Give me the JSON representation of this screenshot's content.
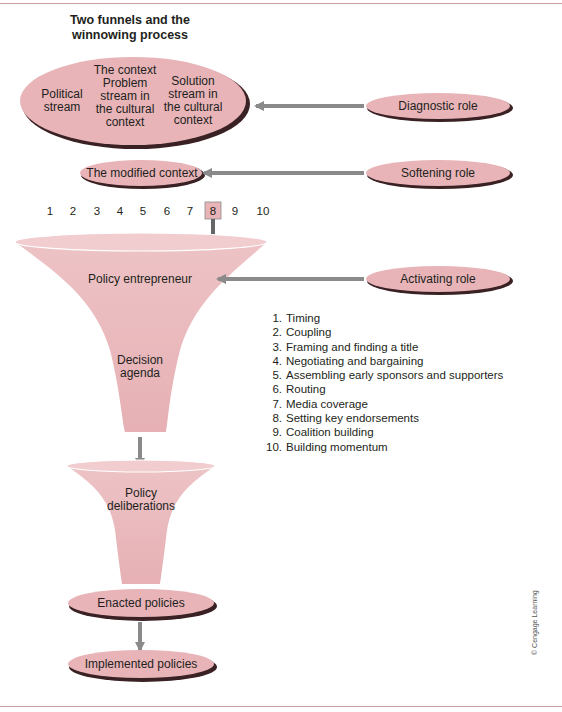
{
  "title": "Two funnels and the winnowing process",
  "streams": {
    "political": "Political stream",
    "problem": "The context Problem stream in the cultural context",
    "solution": "Solution stream in the cultural context"
  },
  "modified_context": "The modified context",
  "roles": {
    "diagnostic": "Diagnostic role",
    "softening": "Softening role",
    "activating": "Activating role"
  },
  "step_numbers": [
    "1",
    "2",
    "3",
    "4",
    "5",
    "6",
    "7",
    "8",
    "9",
    "10"
  ],
  "highlighted_step": "8",
  "funnel_top": {
    "label_top": "Policy entrepreneur",
    "label_bottom": "Decision agenda"
  },
  "funnel_bottom": {
    "label": "Policy deliberations"
  },
  "enacted": "Enacted policies",
  "implemented": "Implemented policies",
  "steps_list": [
    {
      "n": "1.",
      "label": "Timing"
    },
    {
      "n": "2.",
      "label": "Coupling"
    },
    {
      "n": "3.",
      "label": "Framing and finding a title"
    },
    {
      "n": "4.",
      "label": "Negotiating and bargaining"
    },
    {
      "n": "5.",
      "label": "Assembling early sponsors and supporters"
    },
    {
      "n": "6.",
      "label": "Routing"
    },
    {
      "n": "7.",
      "label": "Media coverage"
    },
    {
      "n": "8.",
      "label": "Setting key endorsements"
    },
    {
      "n": "9.",
      "label": "Coalition building"
    },
    {
      "n": "10.",
      "label": "Building momentum"
    }
  ],
  "copyright": "© Cengage Learning",
  "colors": {
    "pink_fill": "#e8b4b8",
    "shadow": "#3a2224",
    "arrow": "#8a8a8a",
    "rule": "#c9a0a2"
  }
}
